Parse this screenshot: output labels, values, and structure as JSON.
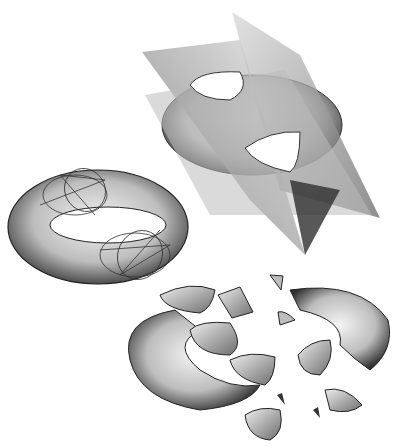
{
  "figure": {
    "panels": [
      {
        "id": "torus-with-cut-curves",
        "label": ""
      },
      {
        "id": "torus-with-three-planes",
        "label": ""
      },
      {
        "id": "exploded-torus-pieces",
        "label": ""
      }
    ],
    "colors": {
      "background": "#ffffff",
      "outline": "#222222",
      "shade_dark": "#3a3a3a",
      "shade_mid": "#9a9a9a",
      "shade_light": "#e6e6e6"
    }
  }
}
